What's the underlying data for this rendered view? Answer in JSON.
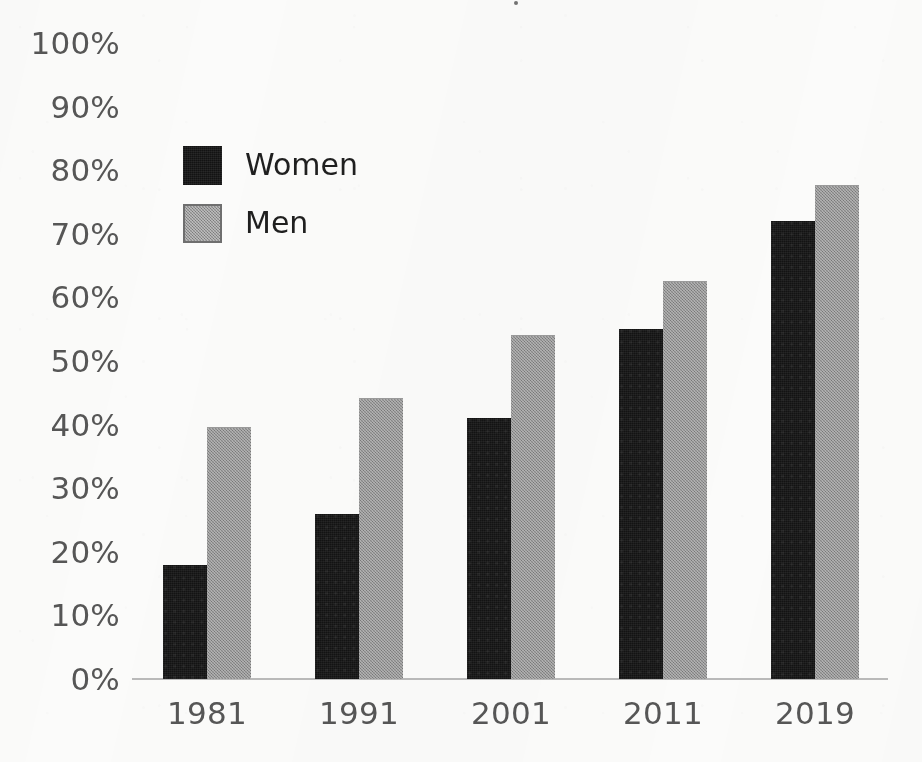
{
  "chart_data": {
    "type": "bar",
    "title": "",
    "subtitle": "",
    "xlabel": "",
    "ylabel": "",
    "categories": [
      "1981",
      "1991",
      "2001",
      "2011",
      "2019"
    ],
    "series": [
      {
        "name": "Women",
        "color": "#131313",
        "values": [
          18,
          26,
          41,
          55,
          72
        ]
      },
      {
        "name": "Men",
        "color": "#8d8d8d",
        "values": [
          39.5,
          44,
          54,
          62.5,
          77.5
        ]
      }
    ],
    "ylim": [
      0,
      100
    ],
    "ytick_values": [
      0,
      10,
      20,
      30,
      40,
      50,
      60,
      70,
      80,
      90,
      100
    ],
    "ytick_labels": [
      "0%",
      "10%",
      "20%",
      "30%",
      "40%",
      "50%",
      "60%",
      "70%",
      "80%",
      "90%",
      "100%"
    ],
    "xtick_labels": [
      "1981",
      "1991",
      "2001",
      "2011",
      "2019"
    ],
    "grid": false,
    "legend_position": "inside-upper-left",
    "legend_entries": [
      "Women",
      "Men"
    ],
    "annotations": []
  },
  "axis": {
    "y_ticks": [
      {
        "label": "100%",
        "value": 100
      },
      {
        "label": "90%",
        "value": 90
      },
      {
        "label": "80%",
        "value": 80
      },
      {
        "label": "70%",
        "value": 70
      },
      {
        "label": "60%",
        "value": 60
      },
      {
        "label": "50%",
        "value": 50
      },
      {
        "label": "40%",
        "value": 40
      },
      {
        "label": "30%",
        "value": 30
      },
      {
        "label": "20%",
        "value": 20
      },
      {
        "label": "10%",
        "value": 10
      },
      {
        "label": "0%",
        "value": 0
      }
    ],
    "x_ticks": [
      "1981",
      "1991",
      "2001",
      "2011",
      "2019"
    ],
    "axis_line_color": "#b9b9b9",
    "tick_label_color": "#565656"
  },
  "legend": {
    "items": [
      {
        "label": "Women",
        "color": "#131313"
      },
      {
        "label": "Men",
        "color": "#8d8d8d"
      }
    ]
  }
}
